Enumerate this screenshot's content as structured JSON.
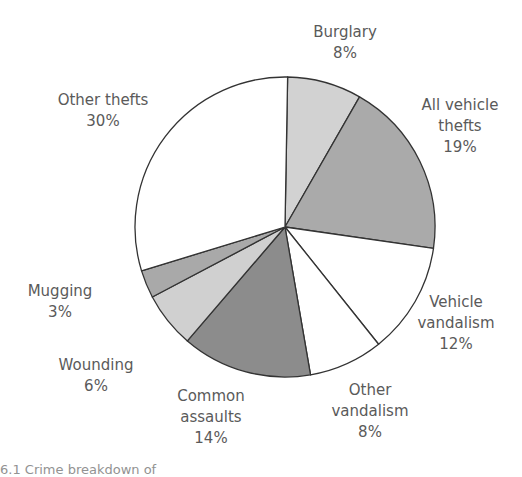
{
  "chart_data": {
    "type": "pie",
    "title": "",
    "start_angle_deg": 0,
    "direction": "clockwise",
    "categories": [
      "Burglary",
      "All vehicle thefts",
      "Vehicle vandalism",
      "Other vandalism",
      "Common assaults",
      "Wounding",
      "Mugging",
      "Other thefts"
    ],
    "values": [
      8,
      19,
      12,
      8,
      14,
      6,
      3,
      30
    ],
    "unit": "%",
    "fills": [
      "#d2d2d2",
      "#aaaaaa",
      "#ffffff",
      "#ffffff",
      "#8c8c8c",
      "#d0d0d0",
      "#a9a9a9",
      "#ffffff"
    ],
    "legend": "none (direct labels)",
    "grid": false
  },
  "labels": [
    {
      "lines": [
        "Burglary",
        "8%"
      ],
      "x": 345,
      "y": 22
    },
    {
      "lines": [
        "All vehicle",
        "thefts",
        "19%"
      ],
      "x": 460,
      "y": 95
    },
    {
      "lines": [
        "Vehicle",
        "vandalism",
        "12%"
      ],
      "x": 456,
      "y": 292
    },
    {
      "lines": [
        "Other",
        "vandalism",
        "8%"
      ],
      "x": 370,
      "y": 380
    },
    {
      "lines": [
        "Common",
        "assaults",
        "14%"
      ],
      "x": 211,
      "y": 386
    },
    {
      "lines": [
        "Wounding",
        "6%"
      ],
      "x": 96,
      "y": 355
    },
    {
      "lines": [
        "Mugging",
        "3%"
      ],
      "x": 60,
      "y": 281
    },
    {
      "lines": [
        "Other thefts",
        "30%"
      ],
      "x": 103,
      "y": 90
    }
  ],
  "caption": "6.1  Crime breakdown of"
}
